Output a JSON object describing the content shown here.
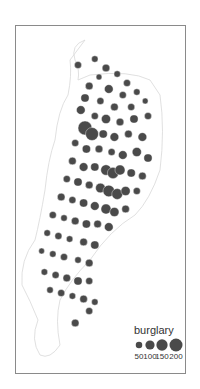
{
  "chart_data": {
    "type": "scatter",
    "subtype": "proportional-symbol-map",
    "title": "",
    "legend": {
      "title": "burglary",
      "position": "bottom-right",
      "entries": [
        {
          "label": "50",
          "value": 50
        },
        {
          "label": "100",
          "value": 100
        },
        {
          "label": "150",
          "value": 150
        },
        {
          "label": "200",
          "value": 200
        }
      ]
    },
    "symbol_color": "#4a4a4a",
    "boundary_color": "#d8d8d8",
    "points": [
      {
        "x": 0.4,
        "y": 0.1,
        "value": 60
      },
      {
        "x": 0.52,
        "y": 0.08,
        "value": 50
      },
      {
        "x": 0.6,
        "y": 0.11,
        "value": 70
      },
      {
        "x": 0.55,
        "y": 0.14,
        "value": 40
      },
      {
        "x": 0.68,
        "y": 0.13,
        "value": 50
      },
      {
        "x": 0.75,
        "y": 0.16,
        "value": 60
      },
      {
        "x": 0.48,
        "y": 0.17,
        "value": 70
      },
      {
        "x": 0.62,
        "y": 0.18,
        "value": 90
      },
      {
        "x": 0.72,
        "y": 0.2,
        "value": 60
      },
      {
        "x": 0.82,
        "y": 0.19,
        "value": 50
      },
      {
        "x": 0.88,
        "y": 0.22,
        "value": 40
      },
      {
        "x": 0.45,
        "y": 0.21,
        "value": 80
      },
      {
        "x": 0.56,
        "y": 0.22,
        "value": 60
      },
      {
        "x": 0.66,
        "y": 0.24,
        "value": 70
      },
      {
        "x": 0.78,
        "y": 0.24,
        "value": 60
      },
      {
        "x": 0.42,
        "y": 0.25,
        "value": 90
      },
      {
        "x": 0.52,
        "y": 0.27,
        "value": 60
      },
      {
        "x": 0.6,
        "y": 0.28,
        "value": 100
      },
      {
        "x": 0.7,
        "y": 0.29,
        "value": 70
      },
      {
        "x": 0.8,
        "y": 0.28,
        "value": 80
      },
      {
        "x": 0.9,
        "y": 0.27,
        "value": 60
      },
      {
        "x": 0.45,
        "y": 0.31,
        "value": 230
      },
      {
        "x": 0.5,
        "y": 0.33,
        "value": 200
      },
      {
        "x": 0.58,
        "y": 0.33,
        "value": 80
      },
      {
        "x": 0.66,
        "y": 0.34,
        "value": 90
      },
      {
        "x": 0.76,
        "y": 0.33,
        "value": 70
      },
      {
        "x": 0.86,
        "y": 0.34,
        "value": 90
      },
      {
        "x": 0.38,
        "y": 0.36,
        "value": 60
      },
      {
        "x": 0.46,
        "y": 0.38,
        "value": 80
      },
      {
        "x": 0.55,
        "y": 0.38,
        "value": 70
      },
      {
        "x": 0.64,
        "y": 0.39,
        "value": 60
      },
      {
        "x": 0.72,
        "y": 0.4,
        "value": 90
      },
      {
        "x": 0.82,
        "y": 0.39,
        "value": 100
      },
      {
        "x": 0.9,
        "y": 0.41,
        "value": 80
      },
      {
        "x": 0.36,
        "y": 0.42,
        "value": 70
      },
      {
        "x": 0.44,
        "y": 0.44,
        "value": 90
      },
      {
        "x": 0.52,
        "y": 0.44,
        "value": 80
      },
      {
        "x": 0.6,
        "y": 0.45,
        "value": 130
      },
      {
        "x": 0.65,
        "y": 0.46,
        "value": 150
      },
      {
        "x": 0.7,
        "y": 0.45,
        "value": 120
      },
      {
        "x": 0.78,
        "y": 0.46,
        "value": 80
      },
      {
        "x": 0.86,
        "y": 0.47,
        "value": 70
      },
      {
        "x": 0.32,
        "y": 0.48,
        "value": 60
      },
      {
        "x": 0.4,
        "y": 0.49,
        "value": 80
      },
      {
        "x": 0.48,
        "y": 0.5,
        "value": 70
      },
      {
        "x": 0.56,
        "y": 0.51,
        "value": 110
      },
      {
        "x": 0.62,
        "y": 0.52,
        "value": 160
      },
      {
        "x": 0.68,
        "y": 0.53,
        "value": 140
      },
      {
        "x": 0.74,
        "y": 0.52,
        "value": 100
      },
      {
        "x": 0.82,
        "y": 0.52,
        "value": 60
      },
      {
        "x": 0.28,
        "y": 0.54,
        "value": 70
      },
      {
        "x": 0.36,
        "y": 0.55,
        "value": 60
      },
      {
        "x": 0.44,
        "y": 0.56,
        "value": 80
      },
      {
        "x": 0.52,
        "y": 0.57,
        "value": 90
      },
      {
        "x": 0.6,
        "y": 0.58,
        "value": 120
      },
      {
        "x": 0.66,
        "y": 0.59,
        "value": 100
      },
      {
        "x": 0.74,
        "y": 0.58,
        "value": 70
      },
      {
        "x": 0.22,
        "y": 0.6,
        "value": 60
      },
      {
        "x": 0.3,
        "y": 0.61,
        "value": 50
      },
      {
        "x": 0.38,
        "y": 0.62,
        "value": 70
      },
      {
        "x": 0.46,
        "y": 0.63,
        "value": 80
      },
      {
        "x": 0.54,
        "y": 0.63,
        "value": 70
      },
      {
        "x": 0.62,
        "y": 0.64,
        "value": 90
      },
      {
        "x": 0.18,
        "y": 0.66,
        "value": 50
      },
      {
        "x": 0.26,
        "y": 0.67,
        "value": 60
      },
      {
        "x": 0.34,
        "y": 0.68,
        "value": 50
      },
      {
        "x": 0.44,
        "y": 0.69,
        "value": 70
      },
      {
        "x": 0.52,
        "y": 0.7,
        "value": 80
      },
      {
        "x": 0.14,
        "y": 0.72,
        "value": 40
      },
      {
        "x": 0.22,
        "y": 0.73,
        "value": 50
      },
      {
        "x": 0.3,
        "y": 0.74,
        "value": 60
      },
      {
        "x": 0.4,
        "y": 0.75,
        "value": 50
      },
      {
        "x": 0.48,
        "y": 0.76,
        "value": 70
      },
      {
        "x": 0.16,
        "y": 0.79,
        "value": 50
      },
      {
        "x": 0.24,
        "y": 0.8,
        "value": 60
      },
      {
        "x": 0.32,
        "y": 0.81,
        "value": 70
      },
      {
        "x": 0.4,
        "y": 0.82,
        "value": 80
      },
      {
        "x": 0.48,
        "y": 0.82,
        "value": 60
      },
      {
        "x": 0.2,
        "y": 0.85,
        "value": 50
      },
      {
        "x": 0.28,
        "y": 0.86,
        "value": 60
      },
      {
        "x": 0.36,
        "y": 0.87,
        "value": 50
      },
      {
        "x": 0.44,
        "y": 0.88,
        "value": 70
      },
      {
        "x": 0.52,
        "y": 0.89,
        "value": 50
      },
      {
        "x": 0.48,
        "y": 0.92,
        "value": 60
      },
      {
        "x": 0.38,
        "y": 0.96,
        "value": 70
      }
    ]
  }
}
